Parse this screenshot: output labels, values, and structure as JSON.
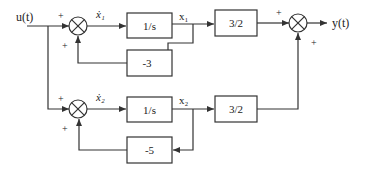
{
  "diagram": {
    "type": "block-diagram",
    "input_label": "u(t)",
    "output_label": "y(t)",
    "branches": [
      {
        "state_derivative_label": "ẋ₁",
        "state_label": "x₁",
        "integrator_label": "1/s",
        "feedback_gain_label": "-3",
        "output_gain_label": "3/2",
        "sum_input_sign": "+",
        "sum_feedback_sign": "+"
      },
      {
        "state_derivative_label": "ẋ₂",
        "state_label": "x₂",
        "integrator_label": "1/s",
        "feedback_gain_label": "-5",
        "output_gain_label": "3/2",
        "sum_input_sign": "+",
        "sum_feedback_sign": "+"
      }
    ],
    "output_sum": {
      "top_sign": "+",
      "bottom_sign": "+"
    }
  }
}
